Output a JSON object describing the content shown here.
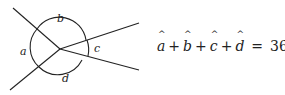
{
  "diagram": {
    "labels": {
      "a": "a",
      "b": "b",
      "c": "c",
      "d": "d"
    },
    "colors": {
      "stroke": "#222222",
      "background": "#ffffff"
    }
  },
  "equation": {
    "terms": [
      "a",
      "b",
      "c",
      "d"
    ],
    "hat": "^",
    "plus": "+",
    "equals": "=",
    "result": "360°"
  }
}
